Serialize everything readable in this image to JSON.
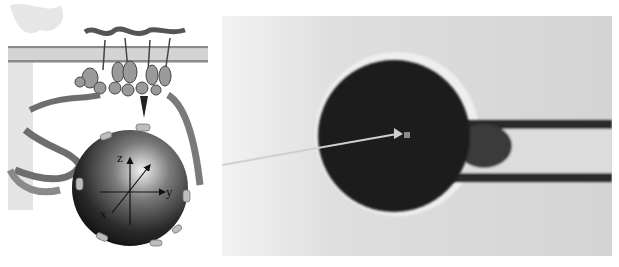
{
  "figure": {
    "left_panel": {
      "description": "Schematic of a bead attached via protein linker to membrane-bound complex",
      "axes": {
        "z": "z",
        "y": "y",
        "x": "x"
      }
    },
    "right_panel": {
      "description": "Micrograph of bead held by micropipette with arrow pointing to center"
    },
    "colors": {
      "background": "#ffffff",
      "micrograph_bg": "#d9d9d9",
      "bead": "#1e1e1e",
      "membrane": "#8a8a8a",
      "protein": "#6e6e6e",
      "arrow": "#cfcfcf"
    }
  }
}
